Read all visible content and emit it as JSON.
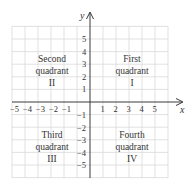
{
  "diagram": {
    "type": "cartesian-coordinate-plane",
    "axes": {
      "x_label": "x",
      "y_label": "y",
      "x_ticks": [
        "−5",
        "−4",
        "−3",
        "−2",
        "−1",
        "1",
        "2",
        "3",
        "4",
        "5"
      ],
      "y_ticks_positive": [
        "5",
        "4",
        "3",
        "2",
        "1"
      ],
      "y_ticks_negative": [
        "−1",
        "−2",
        "−3",
        "−4",
        "−5"
      ]
    },
    "quadrants": {
      "first": {
        "line1": "First",
        "line2": "quadrant",
        "numeral": "I"
      },
      "second": {
        "line1": "Second",
        "line2": "quadrant",
        "numeral": "II"
      },
      "third": {
        "line1": "Third",
        "line2": "quadrant",
        "numeral": "III"
      },
      "fourth": {
        "line1": "Fourth",
        "line2": "quadrant",
        "numeral": "IV"
      }
    },
    "colors": {
      "grid": "#d9d9d9",
      "axis": "#3a3a3a",
      "text": "#333333"
    }
  }
}
